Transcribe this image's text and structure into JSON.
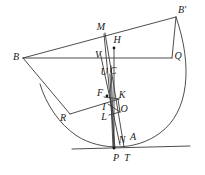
{
  "figure": {
    "kind": "geometry-diagram",
    "width": 205,
    "height": 175,
    "stroke_color": "#3a3a3a",
    "label_color": "#1a1a1a",
    "background_color": "#ffffff",
    "line_width": 0.9
  },
  "labels": [
    {
      "id": "B-prime",
      "text": "B'",
      "x": 182,
      "y": 10
    },
    {
      "id": "M",
      "text": "M",
      "x": 101,
      "y": 27
    },
    {
      "id": "H",
      "text": "H",
      "x": 117,
      "y": 40
    },
    {
      "id": "B",
      "text": "B",
      "x": 16,
      "y": 57
    },
    {
      "id": "V",
      "text": "V",
      "x": 98,
      "y": 55
    },
    {
      "id": "Q",
      "text": "Q",
      "x": 178,
      "y": 56
    },
    {
      "id": "U",
      "text": "U",
      "x": 104,
      "y": 72
    },
    {
      "id": "C",
      "text": "C",
      "x": 113,
      "y": 71
    },
    {
      "id": "F",
      "text": "F",
      "x": 100,
      "y": 93
    },
    {
      "id": "K",
      "text": "K",
      "x": 122,
      "y": 95
    },
    {
      "id": "I",
      "text": "I",
      "x": 104,
      "y": 107
    },
    {
      "id": "O",
      "text": "O",
      "x": 124,
      "y": 109
    },
    {
      "id": "R",
      "text": "R",
      "x": 63,
      "y": 118
    },
    {
      "id": "L",
      "text": "L",
      "x": 104,
      "y": 117
    },
    {
      "id": "N",
      "text": "N",
      "x": 122,
      "y": 140
    },
    {
      "id": "A",
      "text": "A",
      "x": 133,
      "y": 137
    },
    {
      "id": "P",
      "text": "P",
      "x": 116,
      "y": 158
    },
    {
      "id": "T",
      "text": "T",
      "x": 127,
      "y": 158
    }
  ],
  "vertices": {
    "B": {
      "x": 23,
      "y": 58
    },
    "B_prime": {
      "x": 176,
      "y": 17
    },
    "M": {
      "x": 104,
      "y": 34
    },
    "Q": {
      "x": 172,
      "y": 58
    },
    "V": {
      "x": 101,
      "y": 58
    },
    "H_dot": {
      "x": 114,
      "y": 48
    },
    "C": {
      "x": 110,
      "y": 74
    },
    "U": {
      "x": 107,
      "y": 76
    },
    "F_dot": {
      "x": 107,
      "y": 96
    },
    "K": {
      "x": 118,
      "y": 99
    },
    "I": {
      "x": 109,
      "y": 102
    },
    "O": {
      "x": 119,
      "y": 112
    },
    "L": {
      "x": 110,
      "y": 114
    },
    "R": {
      "x": 70,
      "y": 114
    },
    "N": {
      "x": 120,
      "y": 143
    },
    "A": {
      "x": 128,
      "y": 141
    },
    "P": {
      "x": 115,
      "y": 148
    },
    "T": {
      "x": 124,
      "y": 147
    }
  },
  "segments": [
    {
      "name": "B-to-Bprime",
      "x1": 23,
      "y1": 58,
      "x2": 176,
      "y2": 17
    },
    {
      "name": "B-to-Q",
      "x1": 23,
      "y1": 58,
      "x2": 172,
      "y2": 58
    },
    {
      "name": "B-to-R",
      "x1": 23,
      "y1": 58,
      "x2": 70,
      "y2": 114
    },
    {
      "name": "R-to-K",
      "x1": 70,
      "y1": 114,
      "x2": 119,
      "y2": 99
    },
    {
      "name": "Bprime-to-Q",
      "x1": 176,
      "y1": 17,
      "x2": 172,
      "y2": 58
    },
    {
      "name": "baseline",
      "x1": 72,
      "y1": 149,
      "x2": 190,
      "y2": 146
    },
    {
      "name": "M-to-P",
      "x1": 104,
      "y1": 34,
      "x2": 115,
      "y2": 148
    },
    {
      "name": "M-to-T",
      "x1": 105,
      "y1": 33,
      "x2": 124,
      "y2": 147
    },
    {
      "name": "H-to-P",
      "x1": 114,
      "y1": 48,
      "x2": 114,
      "y2": 148
    },
    {
      "name": "V-to-N",
      "x1": 100,
      "y1": 52,
      "x2": 120,
      "y2": 145
    },
    {
      "name": "C-to-P",
      "x1": 111,
      "y1": 66,
      "x2": 114,
      "y2": 149
    },
    {
      "name": "F-to-K",
      "x1": 104,
      "y1": 97,
      "x2": 119,
      "y2": 99
    },
    {
      "name": "I-to-O",
      "x1": 108,
      "y1": 104,
      "x2": 120,
      "y2": 112
    },
    {
      "name": "L-to-O",
      "x1": 109,
      "y1": 115,
      "x2": 120,
      "y2": 112
    },
    {
      "name": "K-to-O",
      "x1": 118,
      "y1": 99,
      "x2": 120,
      "y2": 112
    },
    {
      "name": "C-vertical",
      "x1": 110,
      "y1": 74,
      "x2": 113,
      "y2": 148
    }
  ],
  "arcs": [
    {
      "name": "main-arc-Bprime-A-R",
      "path": "M 176,17 C 193,66 189,112 160,133 C 136,151 101,151 77,136 C 59,124 46,104 40,84",
      "description": "large circular arc sweeping from B' on the right, down past A near the baseline, and up through R to the left"
    }
  ],
  "dots": [
    {
      "name": "dot-H",
      "x": 114,
      "y": 48,
      "r": 1.4
    },
    {
      "name": "dot-F",
      "x": 107,
      "y": 96,
      "r": 1.4
    },
    {
      "name": "dot-P",
      "x": 114,
      "y": 148,
      "r": 1.4
    }
  ]
}
